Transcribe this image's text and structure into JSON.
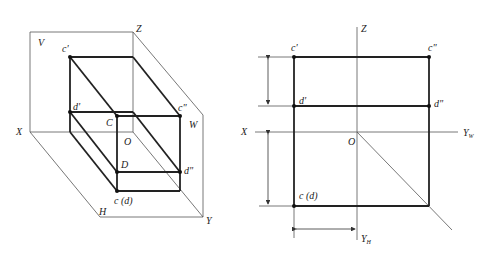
{
  "left_diagram": {
    "title": "Axonometric view of projection planes",
    "planes": {
      "V": "V",
      "W": "W",
      "H": "H"
    },
    "axes": {
      "X": "X",
      "Y": "Y",
      "Z": "Z",
      "O": "O"
    },
    "points": {
      "c_prime": "c'",
      "d_prime": "d'",
      "C": "C",
      "D": "D",
      "c_dprime": "c\"",
      "d_dprime": "d\"",
      "cd": "c (d)"
    }
  },
  "right_diagram": {
    "title": "Orthographic three-view projection",
    "axes": {
      "X": "X",
      "Z": "Z",
      "O": "O",
      "YW": "Y",
      "YW_sub": "W",
      "YH": "Y",
      "YH_sub": "H"
    },
    "points": {
      "c_prime": "c'",
      "d_prime": "d'",
      "c_dprime": "c\"",
      "d_dprime": "d\"",
      "cd": "c (d)"
    }
  }
}
